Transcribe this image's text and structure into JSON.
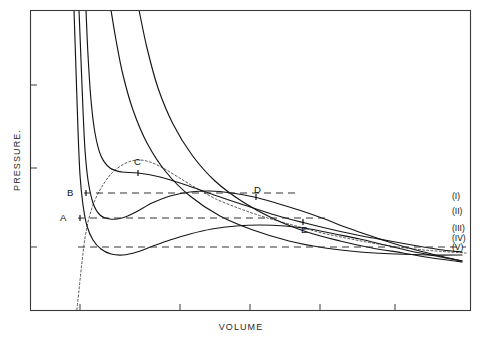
{
  "figure": {
    "title": "",
    "axis": {
      "x_label": "VOLUME",
      "y_label": "PRESSURE."
    },
    "point_labels": [
      {
        "id": "A",
        "text": "A"
      },
      {
        "id": "B",
        "text": "B"
      },
      {
        "id": "C",
        "text": "C"
      },
      {
        "id": "D",
        "text": "D"
      },
      {
        "id": "E",
        "text": "E"
      }
    ],
    "legend": [
      {
        "text": "(I)"
      },
      {
        "text": "(II)"
      },
      {
        "text": "(III)"
      },
      {
        "text": "(IV)"
      },
      {
        "text": "(V)"
      }
    ],
    "colors": {
      "isotherm": "#151515",
      "dome": "#444444",
      "tieline": "#333333",
      "frame": "#3a3a3a",
      "background": "#ffffff"
    }
  },
  "chart_data": {
    "type": "line",
    "title": "",
    "xlabel": "VOLUME",
    "ylabel": "PRESSURE.",
    "xlim": [
      0,
      1
    ],
    "ylim": [
      0,
      1
    ],
    "grid": false,
    "legend_position": "right-edge",
    "series": [
      {
        "name": "(I)",
        "label_y_px": 196,
        "note": "Highest temperature isotherm, monotonic hyperbola-like decrease, no inflection",
        "points_px": [
          [
            111,
            10
          ],
          [
            116,
            40
          ],
          [
            123,
            75
          ],
          [
            133,
            110
          ],
          [
            147,
            143
          ],
          [
            166,
            172
          ],
          [
            190,
            196
          ],
          [
            220,
            216
          ],
          [
            253,
            230
          ],
          [
            289,
            241
          ],
          [
            325,
            248
          ],
          [
            360,
            252
          ],
          [
            395,
            254
          ],
          [
            430,
            255
          ],
          [
            462,
            255
          ]
        ]
      },
      {
        "name": "(II)",
        "label_y_px": 211,
        "note": "Second isotherm, still monotonic but flatter",
        "points_px": [
          [
            139,
            10
          ],
          [
            147,
            48
          ],
          [
            158,
            88
          ],
          [
            173,
            124
          ],
          [
            192,
            155
          ],
          [
            215,
            181
          ],
          [
            243,
            202
          ],
          [
            274,
            219
          ],
          [
            307,
            232
          ],
          [
            340,
            241
          ],
          [
            372,
            248
          ],
          [
            403,
            253
          ],
          [
            432,
            258
          ],
          [
            455,
            261
          ],
          [
            462,
            262
          ]
        ]
      },
      {
        "name": "(III)",
        "label_y_px": 228,
        "note": "Critical isotherm through point C (critical point), horizontal inflection",
        "points_px": [
          [
            86,
            10
          ],
          [
            88,
            55
          ],
          [
            91,
            100
          ],
          [
            95,
            133
          ],
          [
            101,
            156
          ],
          [
            110,
            168
          ],
          [
            122,
            172
          ],
          [
            138,
            173
          ],
          [
            160,
            177
          ],
          [
            186,
            185
          ],
          [
            214,
            195
          ],
          [
            244,
            205
          ],
          [
            275,
            215
          ],
          [
            305,
            223
          ],
          [
            334,
            230
          ],
          [
            362,
            236
          ],
          [
            390,
            241
          ],
          [
            418,
            246
          ],
          [
            443,
            250
          ],
          [
            462,
            252
          ]
        ]
      },
      {
        "name": "(IV)",
        "label_y_px": 238,
        "note": "Subcritical isotherm with van der Waals loop; minimum then maximum; Maxwell tie line B-D at y=193",
        "points_px": [
          [
            79,
            10
          ],
          [
            81,
            60
          ],
          [
            83,
            110
          ],
          [
            85,
            150
          ],
          [
            88,
            180
          ],
          [
            93,
            203
          ],
          [
            100,
            215
          ],
          [
            110,
            219
          ],
          [
            122,
            218
          ],
          [
            136,
            212
          ],
          [
            152,
            203
          ],
          [
            170,
            196
          ],
          [
            190,
            192
          ],
          [
            210,
            191
          ],
          [
            232,
            193
          ],
          [
            254,
            197
          ],
          [
            276,
            203
          ],
          [
            299,
            210
          ],
          [
            322,
            218
          ],
          [
            345,
            227
          ],
          [
            368,
            235
          ],
          [
            392,
            243
          ],
          [
            416,
            250
          ],
          [
            440,
            256
          ],
          [
            462,
            261
          ]
        ]
      },
      {
        "name": "(V)",
        "label_y_px": 247,
        "note": "Lowest temperature isotherm, deepest loop dipping below the axis mid region; Maxwell tie line A-E at y=218",
        "points_px": [
          [
            74,
            10
          ],
          [
            76,
            70
          ],
          [
            78,
            130
          ],
          [
            80,
            175
          ],
          [
            83,
            205
          ],
          [
            87,
            226
          ],
          [
            93,
            240
          ],
          [
            101,
            249
          ],
          [
            111,
            254
          ],
          [
            123,
            255
          ],
          [
            137,
            252
          ],
          [
            153,
            246
          ],
          [
            170,
            240
          ],
          [
            190,
            234
          ],
          [
            212,
            229
          ],
          [
            236,
            226
          ],
          [
            260,
            225
          ],
          [
            285,
            226
          ],
          [
            310,
            229
          ],
          [
            335,
            234
          ],
          [
            360,
            239
          ],
          [
            385,
            245
          ],
          [
            410,
            251
          ],
          [
            436,
            256
          ],
          [
            462,
            261
          ]
        ]
      }
    ],
    "coexistence_dome": {
      "name": "coexistence-curve",
      "style": "dotted",
      "apex_point": "C",
      "points_px": [
        [
          76,
          318
        ],
        [
          79,
          290
        ],
        [
          82,
          262
        ],
        [
          85,
          238
        ],
        [
          89,
          218
        ],
        [
          95,
          200
        ],
        [
          103,
          185
        ],
        [
          112,
          173
        ],
        [
          124,
          164
        ],
        [
          137,
          160
        ],
        [
          150,
          162
        ],
        [
          163,
          168
        ],
        [
          178,
          177
        ],
        [
          196,
          188
        ],
        [
          216,
          199
        ],
        [
          238,
          208
        ],
        [
          258,
          215
        ],
        [
          278,
          221
        ],
        [
          300,
          227
        ],
        [
          322,
          233
        ],
        [
          346,
          238
        ],
        [
          372,
          243
        ],
        [
          398,
          247
        ],
        [
          424,
          250
        ],
        [
          450,
          252
        ],
        [
          466,
          253
        ]
      ]
    },
    "tie_lines": [
      {
        "name": "tie-line-B-D",
        "from_label": "B",
        "to_label": "D",
        "y_px": 193,
        "x_start_px": 84,
        "x_end_px": 300
      },
      {
        "name": "tie-line-A-E",
        "from_label": "A",
        "to_label": "E",
        "y_px": 218,
        "x_start_px": 78,
        "x_end_px": 330
      },
      {
        "name": "tie-line-lower",
        "from_label": "",
        "to_label": "",
        "y_px": 247,
        "x_start_px": 78,
        "x_end_px": 466
      }
    ],
    "marked_points_px": {
      "A": [
        80,
        218
      ],
      "B": [
        86,
        193
      ],
      "C": [
        138,
        173
      ],
      "D": [
        256,
        197
      ],
      "E": [
        303,
        222
      ]
    },
    "x_ticks_px": [
      80,
      180,
      250,
      320,
      395
    ],
    "y_ticks_px": [
      85,
      168,
      247
    ]
  }
}
